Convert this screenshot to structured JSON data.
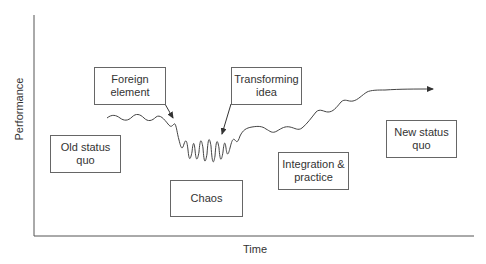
{
  "diagram": {
    "type": "process-curve",
    "axes": {
      "x_label": "Time",
      "y_label": "Performance"
    },
    "stages": [
      {
        "id": "old-status-quo",
        "lines": [
          "Old status",
          "quo"
        ]
      },
      {
        "id": "foreign-element",
        "lines": [
          "Foreign",
          "element"
        ]
      },
      {
        "id": "chaos",
        "lines": [
          "Chaos"
        ]
      },
      {
        "id": "transforming-idea",
        "lines": [
          "Transforming",
          "idea"
        ]
      },
      {
        "id": "integration-practice",
        "lines": [
          "Integration &",
          "practice"
        ]
      },
      {
        "id": "new-status-quo",
        "lines": [
          "New status",
          "quo"
        ]
      }
    ],
    "colors": {
      "line": "#444444",
      "box_border": "#666666",
      "text": "#333333",
      "background": "#ffffff"
    }
  }
}
